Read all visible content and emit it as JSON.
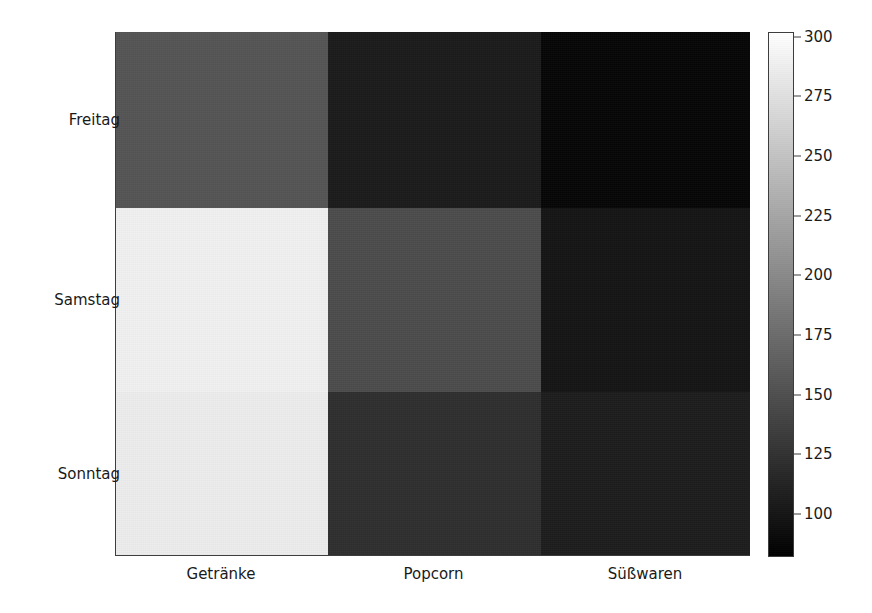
{
  "chart_data": {
    "type": "heatmap",
    "title": "",
    "xlabel": "",
    "ylabel": "",
    "colormap": "gray",
    "grid": false,
    "legend_position": "right",
    "x_categories": [
      "Getränke",
      "Popcorn",
      "Süßwaren"
    ],
    "y_categories": [
      "Freitag",
      "Samstag",
      "Sonntag"
    ],
    "values": [
      [
        155,
        95,
        85
      ],
      [
        295,
        148,
        92
      ],
      [
        290,
        115,
        97
      ]
    ],
    "cells": [
      {
        "row": "Freitag",
        "col": "Getränke",
        "value": 155,
        "color": "#555555"
      },
      {
        "row": "Freitag",
        "col": "Popcorn",
        "value": 95,
        "color": "#1b1b1b"
      },
      {
        "row": "Freitag",
        "col": "Süßwaren",
        "value": 85,
        "color": "#060606"
      },
      {
        "row": "Samstag",
        "col": "Getränke",
        "value": 295,
        "color": "#f1f1f1"
      },
      {
        "row": "Samstag",
        "col": "Popcorn",
        "value": 148,
        "color": "#4c4c4c"
      },
      {
        "row": "Samstag",
        "col": "Süßwaren",
        "value": 92,
        "color": "#151515"
      },
      {
        "row": "Sonntag",
        "col": "Getränke",
        "value": 290,
        "color": "#ededed"
      },
      {
        "row": "Sonntag",
        "col": "Popcorn",
        "value": 115,
        "color": "#2f2f2f"
      },
      {
        "row": "Sonntag",
        "col": "Süßwaren",
        "value": 97,
        "color": "#1d1d1d"
      }
    ],
    "colorbar": {
      "vmin": 82,
      "vmax": 302,
      "ticks": [
        300,
        275,
        250,
        225,
        200,
        175,
        150,
        125,
        100
      ],
      "tick_labels": [
        "300",
        "275",
        "250",
        "225",
        "200",
        "175",
        "150",
        "125",
        "100"
      ],
      "high_color": "#ffffff",
      "low_color": "#000000"
    }
  },
  "axes": {
    "x_tick_labels": [
      "Getränke",
      "Popcorn",
      "Süßwaren"
    ],
    "y_tick_labels": [
      "Freitag",
      "Samstag",
      "Sonntag"
    ]
  }
}
